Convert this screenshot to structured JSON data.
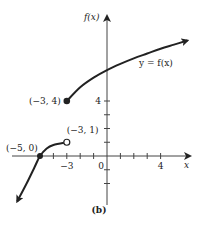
{
  "chart_data": {
    "type": "line",
    "title": "",
    "caption": "(b)",
    "xlabel": "x",
    "ylabel": "f(x)",
    "xlim": [
      -7.5,
      6.5
    ],
    "ylim": [
      -3.5,
      10.5
    ],
    "x_tick_labels": [
      {
        "value": -3,
        "label": "−3"
      },
      {
        "value": 0,
        "label": "0"
      },
      {
        "value": 4,
        "label": "4"
      }
    ],
    "y_tick_labels": [
      {
        "value": 4,
        "label": "4"
      }
    ],
    "x_ticks": [
      -5,
      -4,
      -3,
      -2,
      -1,
      1,
      2,
      3,
      4
    ],
    "y_ticks": [
      -2,
      -1,
      1,
      2,
      3,
      4
    ],
    "series": [
      {
        "name": "lower-branch",
        "points": [
          [
            -6.7,
            -3.3
          ],
          [
            -6.0,
            -2.0
          ],
          [
            -5.4,
            -0.8
          ],
          [
            -5,
            0
          ],
          [
            -4.5,
            0.55
          ],
          [
            -4.0,
            0.8
          ],
          [
            -3,
            1
          ]
        ],
        "start_arrow": true,
        "end_marker": "open"
      },
      {
        "name": "upper-branch",
        "label": "y = f(x)",
        "points": [
          [
            -3,
            4
          ],
          [
            -2,
            5.0
          ],
          [
            -1,
            5.7
          ],
          [
            0,
            6.25
          ],
          [
            1,
            6.7
          ],
          [
            2,
            7.1
          ],
          [
            3,
            7.45
          ],
          [
            4,
            7.8
          ],
          [
            5,
            8.1
          ],
          [
            6,
            8.4
          ]
        ],
        "end_arrow": true,
        "start_marker": "filled"
      }
    ],
    "annotations": [
      {
        "text": "(−5, 0)",
        "point": [
          -5,
          0
        ],
        "marker": "filled"
      },
      {
        "text": "(−3, 1)",
        "point": [
          -3,
          1
        ],
        "marker": "open"
      },
      {
        "text": "(−3, 4)",
        "point": [
          -3,
          4
        ],
        "marker": "filled"
      },
      {
        "text": "y = f(x)",
        "point": [
          4,
          6.5
        ]
      }
    ]
  }
}
